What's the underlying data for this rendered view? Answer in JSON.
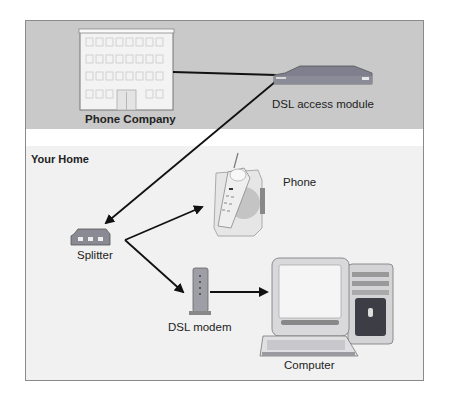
{
  "diagram": {
    "sections": {
      "top": {
        "label": "Phone Company"
      },
      "home": {
        "label": "Your Home"
      }
    },
    "nodes": {
      "phone_company": {
        "label": "Phone Company",
        "icon": "building-icon"
      },
      "dslam": {
        "label": "DSL access module",
        "icon": "dslam-icon"
      },
      "splitter": {
        "label": "Splitter",
        "icon": "splitter-icon"
      },
      "phone": {
        "label": "Phone",
        "icon": "cordless-phone-icon"
      },
      "modem": {
        "label": "DSL modem",
        "icon": "modem-icon"
      },
      "computer": {
        "label": "Computer",
        "icon": "desktop-computer-icon"
      }
    },
    "edges": [
      {
        "from": "Phone Company",
        "to": "DSL access module",
        "type": "line"
      },
      {
        "from": "DSL access module",
        "to": "Splitter",
        "type": "arrow"
      },
      {
        "from": "Splitter",
        "to": "Phone",
        "type": "arrow"
      },
      {
        "from": "Splitter",
        "to": "DSL modem",
        "type": "arrow"
      },
      {
        "from": "DSL modem",
        "to": "Computer",
        "type": "arrow"
      }
    ],
    "colors": {
      "top_band": "#c9c9c9",
      "home_band": "#f1f1f1",
      "line": "#111111"
    }
  }
}
